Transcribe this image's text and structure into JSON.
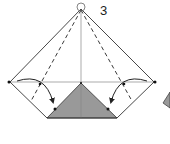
{
  "diagram": {
    "type": "origami-fold-instruction",
    "step_number": "3",
    "colors": {
      "paper_line": "#333333",
      "crease_line": "#888888",
      "colored_side": "#999999",
      "arrow": "#222222",
      "background": "#ffffff"
    },
    "elements": [
      {
        "name": "outer-diamond-outline",
        "description": "kite/diamond shape of folded paper"
      },
      {
        "name": "valley-fold-lines",
        "description": "two dashed lines from apex down each side"
      },
      {
        "name": "fold-arrows",
        "description": "two curved arrows folding side points inward"
      },
      {
        "name": "colored-triangle",
        "description": "gray triangle showing colored side of paper"
      },
      {
        "name": "reference-dots",
        "description": "dots marking alignment points"
      },
      {
        "name": "apex-circle",
        "description": "small circle at top point"
      }
    ]
  }
}
